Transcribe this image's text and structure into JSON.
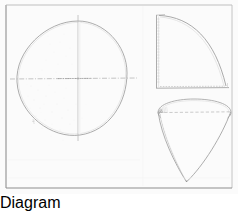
{
  "plate": {
    "title": "Geometric Projection Plate",
    "background_color": "#fdfdfd",
    "border_color": "#8a8a8a",
    "ink_color": "#a8a8a8",
    "ink_color_dark": "#7d7d7d",
    "ink_color_faint": "#d2d2d2",
    "width": 238,
    "height": 194,
    "medium": "faint graphite line drawing on off-white paper",
    "frame": {
      "name": "plate-border",
      "x": 6,
      "y": 5,
      "width": 226,
      "height": 183,
      "stroke_width": 1
    }
  },
  "figures": [
    {
      "id": "plan-circle",
      "name": "Plan view — circle with crossed diameters",
      "label": "",
      "type": "circle",
      "center_x": 72,
      "center_y": 78,
      "radius_x": 55,
      "radius_y": 57,
      "axes": {
        "horizontal_diameter": {
          "x1": 10,
          "y1": 79,
          "x2": 137,
          "y2": 78,
          "style": "dash-dot",
          "name": "horizontal-centerline"
        },
        "vertical_diameter": {
          "x1": 78,
          "y1": 14,
          "x2": 78,
          "y2": 148,
          "style": "solid",
          "name": "vertical-centerline"
        }
      },
      "shading": "faint stipple in lower-left and upper-left quadrants"
    },
    {
      "id": "elevation-quadrant",
      "name": "Elevation view — quarter circle sector",
      "label": "",
      "type": "quarter-circle",
      "corner_x": 156,
      "corner_y": 88,
      "radius": 70,
      "vertical_edge": {
        "x1": 156,
        "y1": 15,
        "x2": 156,
        "y2": 88,
        "name": "quadrant-vertical-edge"
      },
      "horizontal_edge": {
        "x1": 156,
        "y1": 88,
        "x2": 228,
        "y2": 88,
        "style": "dash-dot",
        "name": "quadrant-baseline"
      },
      "arc_from": {
        "x": 158,
        "y": 15
      },
      "arc_to": {
        "x": 227,
        "y": 86
      },
      "hatch_band": "narrow vertical ruling band along left edge"
    },
    {
      "id": "perspective-cone",
      "name": "Perspective view — cone with elliptical base",
      "label": "",
      "type": "cone",
      "apex_x": 186,
      "apex_y": 181,
      "base_center_x": 194,
      "base_center_y": 113,
      "base_radius_x": 38,
      "base_radius_y": 11,
      "chord": {
        "x1": 160,
        "y1": 113,
        "x2": 230,
        "y2": 112,
        "style": "dashed",
        "name": "base-major-chord"
      },
      "ruling_count": 7,
      "ruling_note": "bundle of near-parallel generator lines along the left side converging at apex"
    }
  ],
  "captions": []
}
